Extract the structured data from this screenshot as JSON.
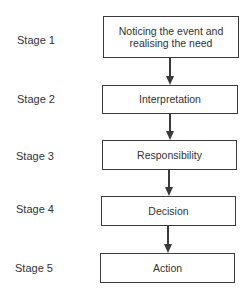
{
  "diagram": {
    "type": "flowchart",
    "direction": "top-to-bottom",
    "stages": [
      {
        "label": "Stage 1",
        "box_text": "Noticing the event and realising the need"
      },
      {
        "label": "Stage 2",
        "box_text": "Interpretation"
      },
      {
        "label": "Stage 3",
        "box_text": "Responsibility"
      },
      {
        "label": "Stage 4",
        "box_text": "Decision"
      },
      {
        "label": "Stage 5",
        "box_text": "Action"
      }
    ],
    "edges": [
      {
        "from": "Stage 1",
        "to": "Stage 2"
      },
      {
        "from": "Stage 2",
        "to": "Stage 3"
      },
      {
        "from": "Stage 3",
        "to": "Stage 4"
      },
      {
        "from": "Stage 4",
        "to": "Stage 5"
      }
    ],
    "colors": {
      "line": "#3a3a3a",
      "text": "#333333",
      "background": "#ffffff"
    }
  }
}
